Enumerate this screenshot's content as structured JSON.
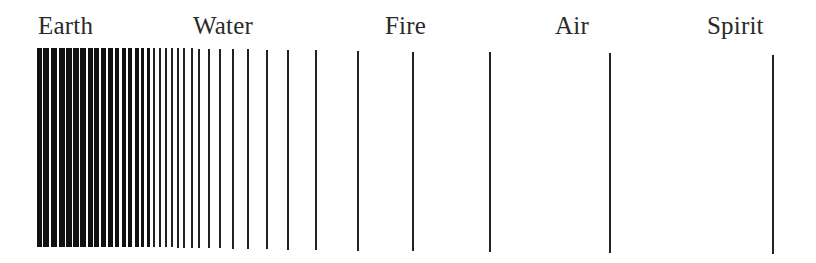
{
  "labels": [
    {
      "text": "Earth",
      "x": 38
    },
    {
      "text": "Water",
      "x": 193
    },
    {
      "text": "Fire",
      "x": 385
    },
    {
      "text": "Air",
      "x": 555
    },
    {
      "text": "Spirit",
      "x": 707
    }
  ],
  "bars": [
    {
      "x": 37,
      "w": 5,
      "top": 48,
      "bottom": 247
    },
    {
      "x": 43,
      "w": 6,
      "top": 48,
      "bottom": 247
    },
    {
      "x": 51,
      "w": 6,
      "top": 48,
      "bottom": 247
    },
    {
      "x": 59,
      "w": 6,
      "top": 48,
      "bottom": 247
    },
    {
      "x": 66,
      "w": 6,
      "top": 48,
      "bottom": 247
    },
    {
      "x": 73,
      "w": 6,
      "top": 48,
      "bottom": 247
    },
    {
      "x": 80,
      "w": 6,
      "top": 48,
      "bottom": 247
    },
    {
      "x": 88,
      "w": 5,
      "top": 48,
      "bottom": 247
    },
    {
      "x": 94,
      "w": 5,
      "top": 48,
      "bottom": 247
    },
    {
      "x": 101,
      "w": 5,
      "top": 48,
      "bottom": 247
    },
    {
      "x": 108,
      "w": 5,
      "top": 48,
      "bottom": 247
    },
    {
      "x": 115,
      "w": 4,
      "top": 48,
      "bottom": 247
    },
    {
      "x": 122,
      "w": 4,
      "top": 48,
      "bottom": 247
    },
    {
      "x": 128,
      "w": 4,
      "top": 48,
      "bottom": 247
    },
    {
      "x": 135,
      "w": 4,
      "top": 48,
      "bottom": 247
    },
    {
      "x": 141,
      "w": 3,
      "top": 48,
      "bottom": 247
    },
    {
      "x": 147,
      "w": 3,
      "top": 48,
      "bottom": 247
    },
    {
      "x": 153,
      "w": 2,
      "top": 48,
      "bottom": 247
    },
    {
      "x": 159,
      "w": 2,
      "top": 48,
      "bottom": 247
    },
    {
      "x": 165,
      "w": 2,
      "top": 48,
      "bottom": 247
    },
    {
      "x": 171,
      "w": 2,
      "top": 48,
      "bottom": 247
    },
    {
      "x": 177,
      "w": 2,
      "top": 48,
      "bottom": 248
    },
    {
      "x": 183,
      "w": 2,
      "top": 48,
      "bottom": 248
    },
    {
      "x": 191,
      "w": 2,
      "top": 48,
      "bottom": 248
    },
    {
      "x": 198,
      "w": 2,
      "top": 49,
      "bottom": 248
    },
    {
      "x": 208,
      "w": 2,
      "top": 49,
      "bottom": 248
    },
    {
      "x": 219,
      "w": 2,
      "top": 49,
      "bottom": 248
    },
    {
      "x": 232,
      "w": 2,
      "top": 49,
      "bottom": 249
    },
    {
      "x": 247,
      "w": 2,
      "top": 49,
      "bottom": 249
    },
    {
      "x": 266,
      "w": 2,
      "top": 50,
      "bottom": 249
    },
    {
      "x": 287,
      "w": 2,
      "top": 50,
      "bottom": 250
    },
    {
      "x": 315,
      "w": 2,
      "top": 50,
      "bottom": 250
    },
    {
      "x": 357,
      "w": 2,
      "top": 51,
      "bottom": 251
    },
    {
      "x": 412,
      "w": 2,
      "top": 52,
      "bottom": 251
    },
    {
      "x": 489,
      "w": 2,
      "top": 52,
      "bottom": 252
    },
    {
      "x": 609,
      "w": 2,
      "top": 53,
      "bottom": 253
    },
    {
      "x": 772,
      "w": 2,
      "top": 55,
      "bottom": 254
    }
  ]
}
